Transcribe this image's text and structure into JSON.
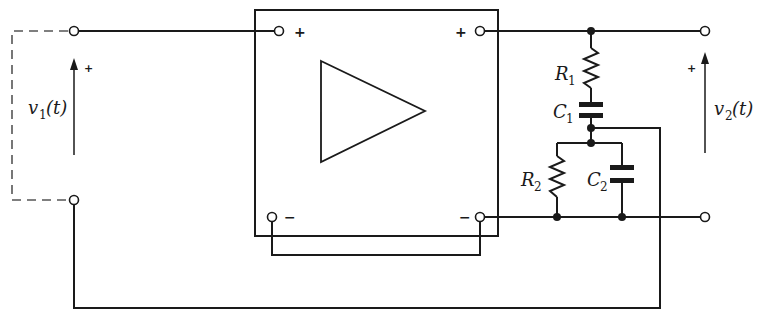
{
  "diagram": {
    "type": "circuit-schematic",
    "amplifier": {
      "symbol": "triangle",
      "input_plus": "+",
      "input_minus": "−",
      "output_plus": "+",
      "output_minus": "−"
    },
    "input": {
      "label": "v",
      "subscript": "1",
      "arg": "(t)",
      "polarity": "+"
    },
    "output": {
      "label": "v",
      "subscript": "2",
      "arg": "(t)",
      "polarity": "+"
    },
    "components": [
      {
        "id": "R1",
        "name": "R",
        "subscript": "1",
        "kind": "resistor"
      },
      {
        "id": "C1",
        "name": "C",
        "subscript": "1",
        "kind": "capacitor"
      },
      {
        "id": "R2",
        "name": "R",
        "subscript": "2",
        "kind": "resistor"
      },
      {
        "id": "C2",
        "name": "C",
        "subscript": "2",
        "kind": "capacitor"
      }
    ],
    "colors": {
      "line": "#1a1a1a",
      "dashed": "#555555",
      "background": "#ffffff"
    }
  }
}
